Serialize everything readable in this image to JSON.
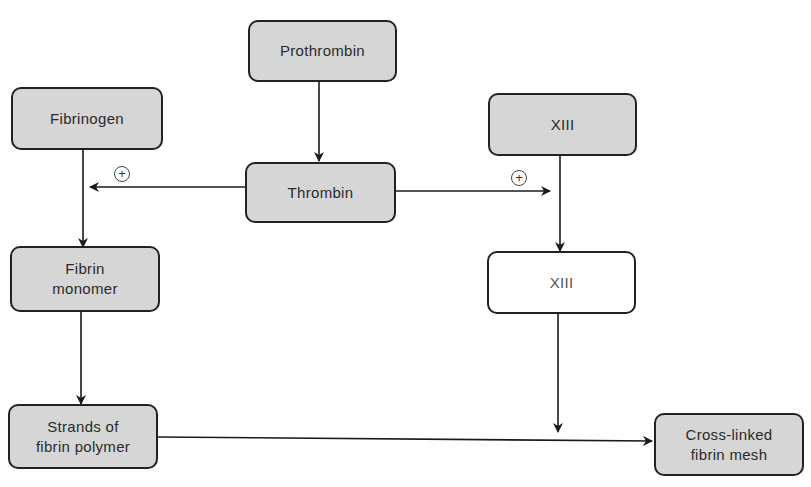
{
  "diagram": {
    "title": "",
    "nodes": [
      {
        "id": "prothrombin",
        "label": "Prothrombin",
        "style": "shaded"
      },
      {
        "id": "fibrinogen",
        "label": "Fibrinogen",
        "style": "shaded"
      },
      {
        "id": "thrombin",
        "label": "Thrombin",
        "style": "shaded"
      },
      {
        "id": "xiii",
        "label": "XIII",
        "style": "shaded"
      },
      {
        "id": "fibrin_monomer",
        "label": "Fibrin\nmonomer",
        "style": "shaded"
      },
      {
        "id": "xiii_activated",
        "label": "XIII",
        "style": "white"
      },
      {
        "id": "fibrin_strands",
        "label": "Strands of\nfibrin polymer",
        "style": "shaded"
      },
      {
        "id": "crosslinked_mesh",
        "label": "Cross-linked\nfibrin mesh",
        "style": "shaded"
      }
    ],
    "edges": [
      {
        "from": "prothrombin",
        "to": "thrombin"
      },
      {
        "from": "thrombin",
        "to": "fibrinogen-line",
        "annotation": "+"
      },
      {
        "from": "thrombin",
        "to": "xiii-line",
        "annotation": "+"
      },
      {
        "from": "fibrinogen",
        "to": "fibrin_monomer"
      },
      {
        "from": "xiii",
        "to": "xiii_activated"
      },
      {
        "from": "fibrin_monomer",
        "to": "fibrin_strands"
      },
      {
        "from": "xiii_activated",
        "to": "strands-mesh-line"
      },
      {
        "from": "fibrin_strands",
        "to": "crosslinked_mesh"
      }
    ],
    "annotations": {
      "plus_left": "+",
      "plus_right": "+"
    },
    "colors": {
      "box_fill": "#d6d6d6",
      "box_border": "#222222",
      "line": "#1a1a1a",
      "white_box_text": "#555555"
    }
  }
}
